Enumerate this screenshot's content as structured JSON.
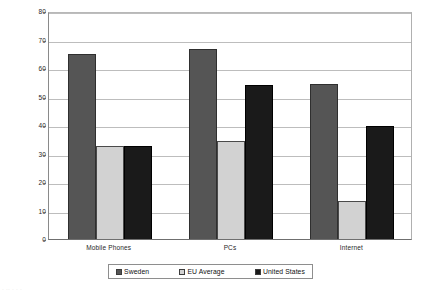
{
  "chart_data": {
    "type": "bar",
    "title": "",
    "subtitle": "",
    "xlabel": "",
    "ylabel": "",
    "categories": [
      "Mobile Phones",
      "PCs",
      "Internet"
    ],
    "series": [
      {
        "name": "Sweden",
        "color": "#555555",
        "values": [
          65,
          66.5,
          54.5
        ]
      },
      {
        "name": "EU Average",
        "color": "#d2d2d2",
        "values": [
          32.5,
          34.5,
          13.5
        ]
      },
      {
        "name": "United States",
        "color": "#1a1a1a",
        "values": [
          32.5,
          54,
          39.5
        ]
      }
    ],
    "ylim": [
      0,
      80
    ],
    "ytick_step": 10,
    "yticks": [
      0,
      10,
      20,
      30,
      40,
      50,
      60,
      70,
      80
    ],
    "ytick_labels": [
      "0",
      "10",
      "20",
      "30",
      "40",
      "50",
      "60",
      "70",
      "80"
    ],
    "grid": true,
    "grid_axis": "y",
    "legend": true,
    "legend_position": "bottom"
  },
  "legend": {
    "items": [
      {
        "label": "Sweden",
        "swatch": "sweden-swatch"
      },
      {
        "label": "EU Average",
        "swatch": "eu-average-swatch"
      },
      {
        "label": "United States",
        "swatch": "united-states-swatch"
      }
    ]
  },
  "footer": {
    "artifact_text": "·  ·· ·  ·   ·"
  }
}
